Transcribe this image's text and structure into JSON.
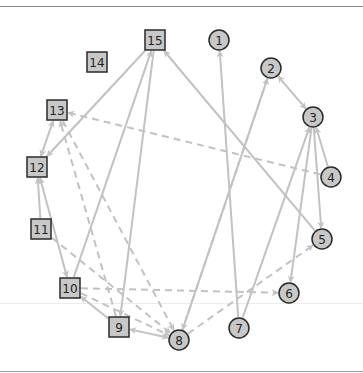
{
  "diagram": {
    "type": "directed-graph",
    "colors": {
      "node_fill": "#c8c8c8",
      "node_stroke": "#2a2a2a",
      "edge": "#c2c2c2",
      "background": "#ffffff"
    },
    "nodes": [
      {
        "id": "1",
        "label": "1",
        "shape": "circle",
        "x": 219,
        "y": 40
      },
      {
        "id": "2",
        "label": "2",
        "shape": "circle",
        "x": 271,
        "y": 68
      },
      {
        "id": "3",
        "label": "3",
        "shape": "circle",
        "x": 313,
        "y": 117
      },
      {
        "id": "4",
        "label": "4",
        "shape": "circle",
        "x": 331,
        "y": 177
      },
      {
        "id": "5",
        "label": "5",
        "shape": "circle",
        "x": 322,
        "y": 239
      },
      {
        "id": "6",
        "label": "6",
        "shape": "circle",
        "x": 289,
        "y": 293
      },
      {
        "id": "7",
        "label": "7",
        "shape": "circle",
        "x": 239,
        "y": 328
      },
      {
        "id": "8",
        "label": "8",
        "shape": "circle",
        "x": 179,
        "y": 340
      },
      {
        "id": "9",
        "label": "9",
        "shape": "square",
        "x": 119,
        "y": 327
      },
      {
        "id": "10",
        "label": "10",
        "shape": "square",
        "x": 70,
        "y": 288
      },
      {
        "id": "11",
        "label": "11",
        "shape": "square",
        "x": 41,
        "y": 229
      },
      {
        "id": "12",
        "label": "12",
        "shape": "square",
        "x": 37,
        "y": 167
      },
      {
        "id": "13",
        "label": "13",
        "shape": "square",
        "x": 57,
        "y": 110
      },
      {
        "id": "14",
        "label": "14",
        "shape": "square",
        "x": 97,
        "y": 62
      },
      {
        "id": "15",
        "label": "15",
        "shape": "square",
        "x": 155,
        "y": 40
      }
    ],
    "edges": [
      {
        "from": "7",
        "to": "1",
        "style": "solid"
      },
      {
        "from": "8",
        "to": "2",
        "style": "solid"
      },
      {
        "from": "2",
        "to": "8",
        "style": "dashed"
      },
      {
        "from": "2",
        "to": "3",
        "style": "solid",
        "bidirectional": true
      },
      {
        "from": "4",
        "to": "3",
        "style": "solid"
      },
      {
        "from": "3",
        "to": "5",
        "style": "solid"
      },
      {
        "from": "3",
        "to": "6",
        "style": "solid"
      },
      {
        "from": "7",
        "to": "3",
        "style": "solid"
      },
      {
        "from": "4",
        "to": "13",
        "style": "dashed"
      },
      {
        "from": "5",
        "to": "15",
        "style": "solid"
      },
      {
        "from": "8",
        "to": "5",
        "style": "dashed"
      },
      {
        "from": "10",
        "to": "6",
        "style": "dashed"
      },
      {
        "from": "15",
        "to": "12",
        "style": "solid"
      },
      {
        "from": "10",
        "to": "15",
        "style": "solid"
      },
      {
        "from": "15",
        "to": "9",
        "style": "solid"
      },
      {
        "from": "12",
        "to": "13",
        "style": "solid",
        "bidirectional": true
      },
      {
        "from": "11",
        "to": "12",
        "style": "solid"
      },
      {
        "from": "12",
        "to": "10",
        "style": "solid",
        "bidirectional": true
      },
      {
        "from": "9",
        "to": "13",
        "style": "dashed"
      },
      {
        "from": "13",
        "to": "8",
        "style": "dashed"
      },
      {
        "from": "11",
        "to": "8",
        "style": "dashed"
      },
      {
        "from": "9",
        "to": "10",
        "style": "solid"
      },
      {
        "from": "9",
        "to": "8",
        "style": "solid",
        "bidirectional": true
      },
      {
        "from": "10",
        "to": "8",
        "style": "dashed"
      }
    ]
  }
}
